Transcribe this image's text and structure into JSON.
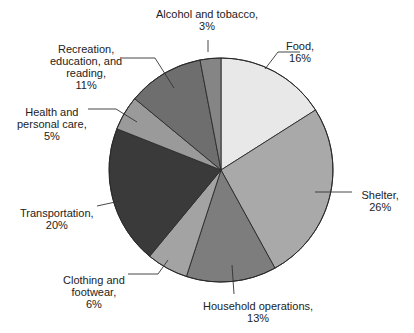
{
  "chart_data": {
    "type": "pie",
    "title": "",
    "start_angle_deg": 0,
    "direction": "clockwise",
    "unit": "%",
    "categories": [
      "Food",
      "Shelter",
      "Household operations",
      "Clothing and footwear",
      "Transportation",
      "Health and personal care",
      "Recreation, education, and reading",
      "Alcohol and tobacco"
    ],
    "values": [
      16,
      26,
      13,
      6,
      20,
      5,
      11,
      3
    ],
    "slices": [
      {
        "name": "Food",
        "value": 16,
        "color": "#e8e8e8",
        "label_lines": [
          "Food,",
          "16%"
        ]
      },
      {
        "name": "Shelter",
        "value": 26,
        "color": "#a9a9a9",
        "label_lines": [
          "Shelter,",
          "26%"
        ]
      },
      {
        "name": "Household operations",
        "value": 13,
        "color": "#7d7d7d",
        "label_lines": [
          "Household operations,",
          "13%"
        ]
      },
      {
        "name": "Clothing and footwear",
        "value": 6,
        "color": "#a3a3a3",
        "label_lines": [
          "Clothing and",
          "footwear,",
          "6%"
        ]
      },
      {
        "name": "Transportation",
        "value": 20,
        "color": "#3a3a3a",
        "label_lines": [
          "Transportation,",
          "20%"
        ]
      },
      {
        "name": "Health and personal care",
        "value": 5,
        "color": "#9a9a9a",
        "label_lines": [
          "Health and",
          "personal care,",
          "5%"
        ]
      },
      {
        "name": "Recreation, education, and reading",
        "value": 11,
        "color": "#6e6e6e",
        "label_lines": [
          "Recreation,",
          "education, and",
          "reading,",
          "11%"
        ]
      },
      {
        "name": "Alcohol and tobacco",
        "value": 3,
        "color": "#858585",
        "label_lines": [
          "Alcohol and tobacco,",
          "3%"
        ]
      }
    ],
    "legend": "none (direct labels with leader lines)"
  },
  "layout": {
    "center": [
      221,
      170
    ],
    "radius": 112,
    "labels": [
      {
        "x": 300,
        "y": 40,
        "leader": [
          [
            265,
            69
          ],
          [
            278,
            52
          ],
          [
            300,
            52
          ]
        ]
      },
      {
        "x": 380,
        "y": 189,
        "leader": [
          [
            315,
            192
          ],
          [
            352,
            192
          ]
        ]
      },
      {
        "x": 258,
        "y": 300,
        "leader": [
          [
            232,
            265
          ],
          [
            234,
            294
          ]
        ]
      },
      {
        "x": 94,
        "y": 274,
        "leader": [
          [
            168,
            260
          ],
          [
            158,
            274
          ],
          [
            128,
            274
          ]
        ]
      },
      {
        "x": 57,
        "y": 207,
        "leader": [
          [
            120,
            201
          ],
          [
            97,
            206
          ]
        ]
      },
      {
        "x": 52,
        "y": 106,
        "leader": [
          [
            137,
            122
          ],
          [
            116,
            109
          ],
          [
            88,
            109
          ]
        ]
      },
      {
        "x": 86,
        "y": 43,
        "leader": [
          [
            174,
            88
          ],
          [
            155,
            58
          ],
          [
            122,
            58
          ]
        ]
      },
      {
        "x": 207,
        "y": 8,
        "leader": [
          [
            208,
            40
          ],
          [
            208,
            52
          ]
        ]
      }
    ]
  }
}
